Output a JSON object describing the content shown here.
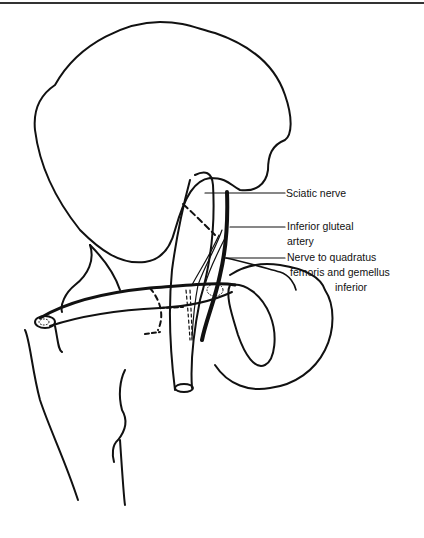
{
  "figure": {
    "type": "anatomical line drawing",
    "labels": [
      {
        "id": "sciatic-nerve",
        "text": "Sciatic nerve"
      },
      {
        "id": "inferior-gluteal-artery",
        "lines": [
          "Inferior gluteal",
          "artery"
        ]
      },
      {
        "id": "nerve-to-quadratus",
        "lines": [
          "Nerve to quadratus",
          "femoris and gemellus",
          "inferior"
        ]
      }
    ],
    "colors": {
      "line": "#111111",
      "background": "#ffffff"
    }
  }
}
